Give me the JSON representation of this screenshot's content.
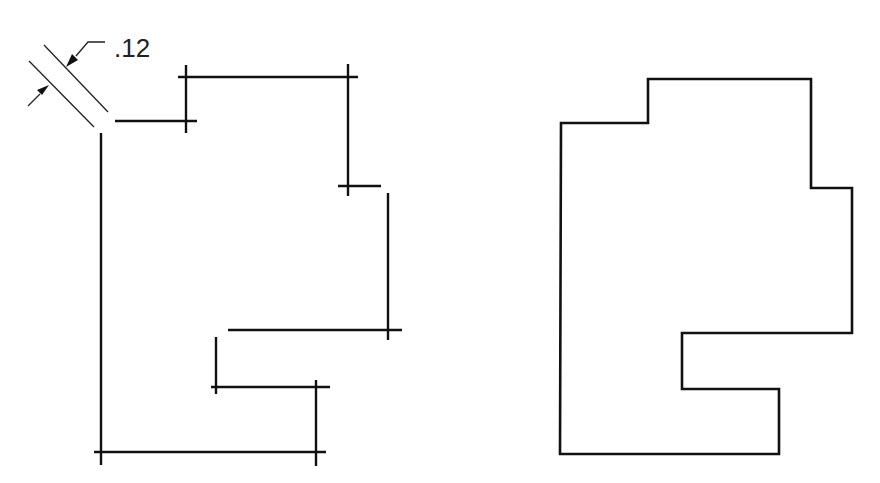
{
  "figure": {
    "stroke_color": "#111111",
    "background": "#ffffff"
  },
  "left_drawing": {
    "dimension": {
      "label": ".12",
      "meaning": "offset distance between parallel lines"
    },
    "segments": [
      {
        "x1": 101,
        "y1": 133,
        "x2": 101,
        "y2": 465
      },
      {
        "x1": 115,
        "y1": 121,
        "x2": 197,
        "y2": 121
      },
      {
        "x1": 186,
        "y1": 65,
        "x2": 186,
        "y2": 133
      },
      {
        "x1": 178,
        "y1": 77,
        "x2": 358,
        "y2": 77
      },
      {
        "x1": 348,
        "y1": 64,
        "x2": 348,
        "y2": 196
      },
      {
        "x1": 338,
        "y1": 186,
        "x2": 381,
        "y2": 186
      },
      {
        "x1": 388,
        "y1": 193,
        "x2": 388,
        "y2": 340
      },
      {
        "x1": 228,
        "y1": 330,
        "x2": 402,
        "y2": 330
      },
      {
        "x1": 216,
        "y1": 337,
        "x2": 216,
        "y2": 394
      },
      {
        "x1": 211,
        "y1": 387,
        "x2": 330,
        "y2": 387
      },
      {
        "x1": 316,
        "y1": 380,
        "x2": 316,
        "y2": 466
      },
      {
        "x1": 94,
        "y1": 452,
        "x2": 326,
        "y2": 452
      }
    ]
  },
  "right_drawing": {
    "outline_points": "561,123 648,123 648,79 811,79 811,188 852,188 852,333 682,333 682,389 779,389 779,454 560,454"
  }
}
